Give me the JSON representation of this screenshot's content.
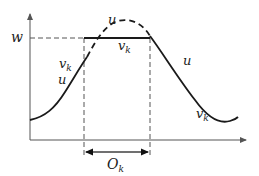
{
  "diagram": {
    "type": "function-truncation-plot",
    "labels": {
      "level": "w",
      "u_left": "u",
      "u_peak": "u",
      "u_right": "u",
      "vk_left": "v",
      "vk_top": "v",
      "vk_right": "v",
      "subscript_k": "k",
      "interval": "O",
      "interval_sub": "k"
    },
    "colors": {
      "curve": "#1a1a1a",
      "axis": "#555555",
      "dashed": "#555555",
      "background": "#ffffff"
    }
  }
}
